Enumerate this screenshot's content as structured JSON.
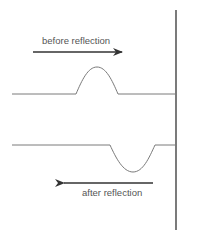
{
  "diagram": {
    "type": "wave-pulse-reflection",
    "labels": {
      "before": "before reflection",
      "after": "after reflection"
    },
    "colors": {
      "wave": "#7a7a7a",
      "wall": "#333333",
      "arrow": "#333333",
      "text": "#555555"
    },
    "elements": [
      {
        "id": "wall",
        "kind": "vertical-boundary"
      },
      {
        "id": "incident-pulse",
        "kind": "upright-pulse",
        "direction": "right"
      },
      {
        "id": "reflected-pulse",
        "kind": "inverted-pulse",
        "direction": "left"
      }
    ]
  }
}
